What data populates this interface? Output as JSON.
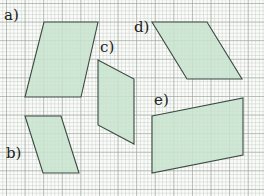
{
  "figure": {
    "grid": {
      "minor_cell_px": 3.72,
      "major_every": 5
    },
    "fill_color": "#c8e3cf",
    "stroke_color": "#3a4a40"
  },
  "shapes": [
    {
      "id": "a",
      "label": "a)",
      "points": "44,22 98,22 81,97 25,97",
      "label_pos": {
        "x": 4,
        "y": 8
      }
    },
    {
      "id": "b",
      "label": "b)",
      "points": "25,116 61,116 79,173 43,173",
      "label_pos": {
        "x": 6,
        "y": 146
      }
    },
    {
      "id": "c",
      "label": "c)",
      "points": "98,60 134,79 134,144 98,125",
      "label_pos": {
        "x": 100,
        "y": 40
      }
    },
    {
      "id": "d",
      "label": "d)",
      "points": "152,22 207,22 242,79 187,79",
      "label_pos": {
        "x": 134,
        "y": 20
      }
    },
    {
      "id": "e",
      "label": "e)",
      "points": "152,116 243,98 243,155 152,173",
      "label_pos": {
        "x": 154,
        "y": 93
      }
    }
  ]
}
